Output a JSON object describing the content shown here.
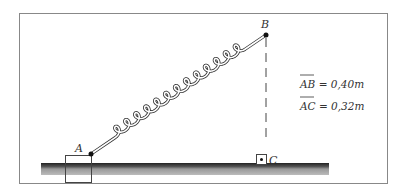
{
  "diagram": {
    "points": {
      "A": "A",
      "B": "B",
      "C": "C"
    },
    "equations": [
      {
        "segment": "AB",
        "rest": " = 0,40m"
      },
      {
        "segment": "AC",
        "rest": " = 0,32m"
      }
    ],
    "colors": {
      "frame": "#777777",
      "ink": "#222222",
      "ground_top": "#333333",
      "ground_shade": "#aaaaaa"
    }
  }
}
